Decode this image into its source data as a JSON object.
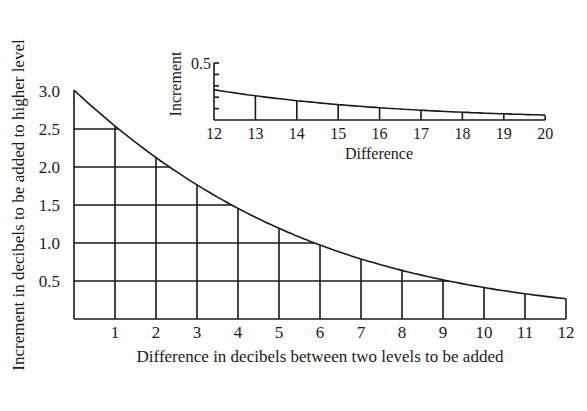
{
  "chart_data": [
    {
      "type": "line",
      "title": "",
      "xlabel": "Difference in decibels between two levels to be added",
      "ylabel": "Increment in decibels to be added to higher level",
      "xlim": [
        0,
        12
      ],
      "ylim": [
        0,
        3.0
      ],
      "grid": true,
      "x_ticks": [
        "1",
        "2",
        "3",
        "4",
        "5",
        "6",
        "7",
        "8",
        "9",
        "10",
        "11",
        "12"
      ],
      "y_ticks": [
        "0.5",
        "1.0",
        "1.5",
        "2.0",
        "2.5",
        "3.0"
      ],
      "x": [
        0,
        1,
        2,
        3,
        4,
        5,
        6,
        7,
        8,
        9,
        10,
        11,
        12
      ],
      "values": [
        3.01,
        2.54,
        2.12,
        1.76,
        1.46,
        1.19,
        0.97,
        0.79,
        0.64,
        0.51,
        0.41,
        0.33,
        0.27
      ]
    },
    {
      "type": "line",
      "title": "",
      "xlabel": "Difference",
      "ylabel": "Increment",
      "xlim": [
        12,
        20
      ],
      "ylim": [
        0,
        0.5
      ],
      "grid": true,
      "x_ticks": [
        "12",
        "13",
        "14",
        "15",
        "16",
        "17",
        "18",
        "19",
        "20"
      ],
      "y_ticks": [
        "0.5"
      ],
      "x": [
        12,
        13,
        14,
        15,
        16,
        17,
        18,
        19,
        20
      ],
      "values": [
        0.27,
        0.21,
        0.17,
        0.14,
        0.11,
        0.09,
        0.07,
        0.05,
        0.04
      ]
    }
  ]
}
